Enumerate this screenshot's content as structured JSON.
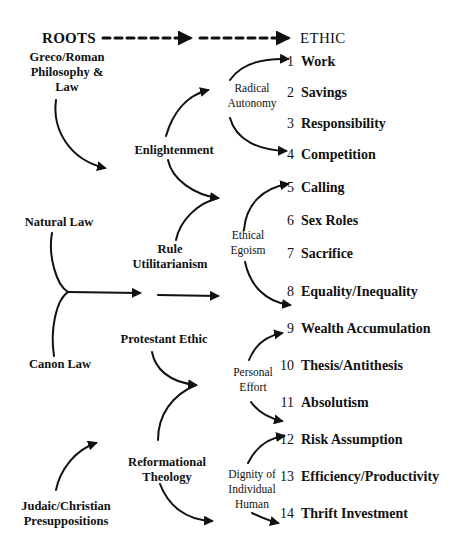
{
  "header": {
    "left": "ROOTS",
    "right": "ETHIC"
  },
  "roots": {
    "greco_roman": [
      "Greco/Roman",
      "Philosophy &",
      "Law"
    ],
    "natural_law": "Natural Law",
    "canon_law": "Canon Law",
    "judaic_christian": [
      "Judaic/Christian",
      "Presuppositions"
    ]
  },
  "intermediate": {
    "enlightenment": "Enlightenment",
    "rule_utilitarianism": [
      "Rule",
      "Utilitarianism"
    ],
    "protestant_ethic": "Protestant Ethic",
    "reformational_theology": [
      "Reformational",
      "Theology"
    ]
  },
  "principles": {
    "radical_autonomy": [
      "Radical",
      "Autonomy"
    ],
    "ethical_egoism": [
      "Ethical",
      "Egoism"
    ],
    "personal_effort": [
      "Personal",
      "Effort"
    ],
    "dignity": [
      "Dignity of",
      "Individual",
      "Human"
    ]
  },
  "ethics": [
    {
      "num": "1",
      "label": "Work"
    },
    {
      "num": "2",
      "label": "Savings"
    },
    {
      "num": "3",
      "label": "Responsibility"
    },
    {
      "num": "4",
      "label": "Competition"
    },
    {
      "num": "5",
      "label": "Calling"
    },
    {
      "num": "6",
      "label": "Sex Roles"
    },
    {
      "num": "7",
      "label": "Sacrifice"
    },
    {
      "num": "8",
      "label": "Equality/Inequality"
    },
    {
      "num": "9",
      "label": "Wealth Accumulation"
    },
    {
      "num": "10",
      "label": "Thesis/Antithesis"
    },
    {
      "num": "11",
      "label": "Absolutism"
    },
    {
      "num": "12",
      "label": "Risk Assumption"
    },
    {
      "num": "13",
      "label": "Efficiency/Productivity"
    },
    {
      "num": "14",
      "label": "Thrift Investment"
    }
  ],
  "colors": {
    "ink": "#111111",
    "background": "#ffffff"
  }
}
